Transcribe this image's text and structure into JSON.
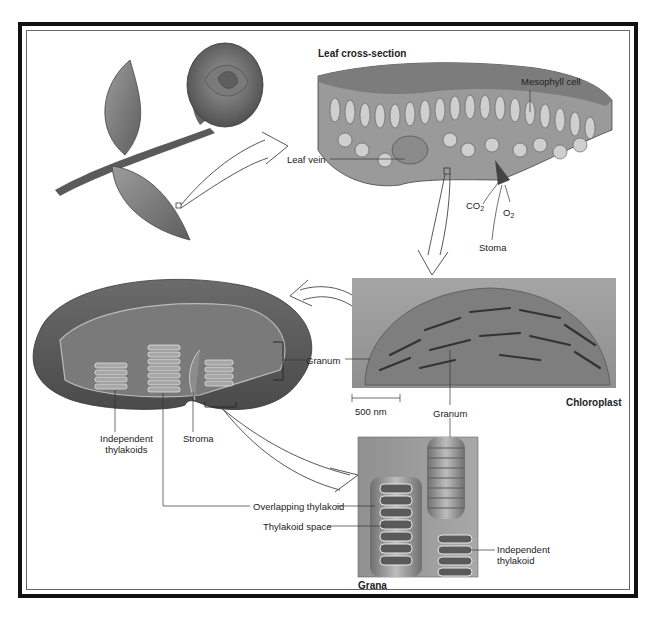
{
  "figure": {
    "panels": {
      "rose": {
        "name": "Rose plant"
      },
      "leaf": {
        "title": "Leaf cross-section"
      },
      "micrograph": {
        "title": "Chloroplast",
        "scale_bar": "500 nm"
      },
      "chloroplast_model": {
        "name": "Chloroplast 3D model"
      },
      "grana": {
        "title": "Grana"
      }
    },
    "labels": {
      "leaf_vein": "Leaf vein",
      "mesophyll_cell": "Mesophyll cell",
      "co2": "CO",
      "co2_sub": "2",
      "o2": "O",
      "o2_sub": "2",
      "stoma": "Stoma",
      "granum_left": "Granum",
      "granum_bottom": "Granum",
      "independent_thylakoids_1": "Independent",
      "independent_thylakoids_2": "thylakoids",
      "stroma": "Stroma",
      "overlapping_thylakoid": "Overlapping thylakoid",
      "thylakoid_space": "Thylakoid space",
      "independent_thylakoid_1": "Independent",
      "independent_thylakoid_2": "thylakoid"
    },
    "colors": {
      "frame": "#111111",
      "line": "#333333",
      "tissue_light": "#bdbdbd",
      "tissue_mid": "#8a8a8a",
      "tissue_dark": "#555555"
    }
  }
}
